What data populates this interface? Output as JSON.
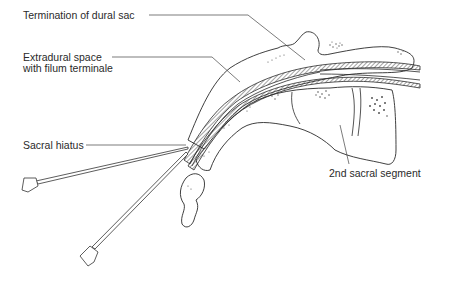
{
  "diagram": {
    "labels": [
      {
        "id": "dural-sac",
        "text": "Termination of dural sac"
      },
      {
        "id": "extradural-1",
        "text": "Extradural space"
      },
      {
        "id": "extradural-2",
        "text": "with filum terminale"
      },
      {
        "id": "sacral-hiatus",
        "text": "Sacral hiatus"
      },
      {
        "id": "sacral-segment",
        "text": "2nd sacral segment"
      }
    ],
    "components": [
      "sacrum",
      "coccyx",
      "dural sac",
      "filum terminale",
      "epidural space",
      "needle (horizontal approach)",
      "needle (steep approach)"
    ],
    "colors": {
      "ink": "#2a2a2a",
      "background": "#ffffff"
    }
  }
}
